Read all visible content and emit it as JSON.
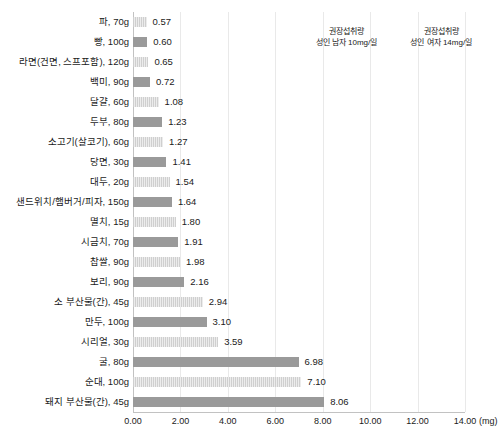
{
  "chart_data": {
    "type": "bar",
    "orientation": "horizontal",
    "title": "",
    "xlabel": "(mg)",
    "ylabel": "",
    "xlim": [
      0,
      14
    ],
    "grid": true,
    "legend_position": "none",
    "unit": "(mg)",
    "tick_labels": [
      "0.00",
      "2.00",
      "4.00",
      "6.00",
      "8.00",
      "10.00",
      "12.00",
      "14.00"
    ],
    "tick_values": [
      0,
      2,
      4,
      6,
      8,
      10,
      12,
      14
    ],
    "categories": [
      "파, 70g",
      "빵, 100g",
      "라면(건면, 스프포함), 120g",
      "백미, 90g",
      "달걀, 60g",
      "두부, 80g",
      "소고기(살코기), 60g",
      "당면, 30g",
      "대두, 20g",
      "샌드위치/햄버거/피자, 150g",
      "멸치, 15g",
      "시금치, 70g",
      "찹쌀, 90g",
      "보리, 90g",
      "소 부산물(간), 45g",
      "만두, 100g",
      "시리얼, 30g",
      "굴, 80g",
      "순대, 100g",
      "돼지 부산물(간), 45g"
    ],
    "values": [
      0.57,
      0.6,
      0.65,
      0.72,
      1.08,
      1.23,
      1.27,
      1.41,
      1.54,
      1.64,
      1.8,
      1.91,
      1.98,
      2.16,
      2.94,
      3.1,
      3.59,
      6.98,
      7.1,
      8.06
    ],
    "value_labels": [
      "0.57",
      "0.60",
      "0.65",
      "0.72",
      "1.08",
      "1.23",
      "1.27",
      "1.41",
      "1.54",
      "1.64",
      "1.80",
      "1.91",
      "1.98",
      "2.16",
      "2.94",
      "3.10",
      "3.59",
      "6.98",
      "7.10",
      "8.06"
    ],
    "bar_styles": [
      "striped",
      "solid",
      "striped",
      "solid",
      "striped",
      "solid",
      "striped",
      "solid",
      "striped",
      "solid",
      "striped",
      "solid",
      "striped",
      "solid",
      "striped",
      "solid",
      "striped",
      "solid",
      "striped",
      "solid"
    ],
    "colors": {
      "bar_solid": "#9a9a9a",
      "bar_striped": "#dcdcdc",
      "gridline": "#e9e9e9",
      "axis": "#c2c2c2",
      "text": "#1a1a1a",
      "background": "#ffffff"
    },
    "annotations": [
      {
        "line1": "권장섭취량",
        "line2": "성인 남자 10mg/일",
        "at_value": 10
      },
      {
        "line1": "권장섭취량",
        "line2": "성인 여자 14mg/일",
        "at_value": 14
      }
    ]
  }
}
